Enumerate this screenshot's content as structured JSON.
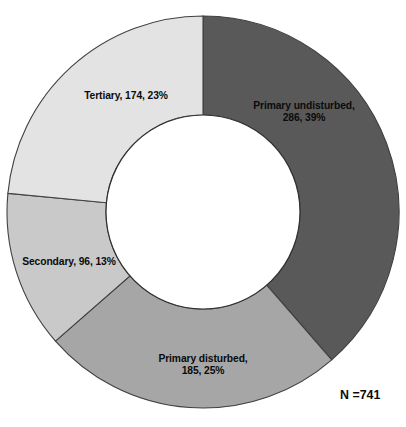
{
  "chart_data": {
    "type": "pie",
    "variant": "donut",
    "title": "",
    "subtitle": "",
    "xlabel": "",
    "ylabel": "",
    "legend_position": "none",
    "grid": false,
    "start_angle_deg": 0,
    "direction": "clockwise",
    "total": 741,
    "total_annotation": "N =741",
    "categories": [
      "Primary undisturbed",
      "Primary disturbed",
      "Secondary",
      "Tertiary"
    ],
    "values": [
      286,
      185,
      96,
      174
    ],
    "percentages": [
      39,
      25,
      13,
      23
    ],
    "slices": [
      {
        "name": "Primary undisturbed",
        "value": 286,
        "percent": 39,
        "label": "Primary undisturbed,\n286, 39%",
        "color": "#595959"
      },
      {
        "name": "Primary disturbed",
        "value": 185,
        "percent": 25,
        "label": "Primary disturbed,\n185, 25%",
        "color": "#a6a6a6"
      },
      {
        "name": "Secondary",
        "value": 96,
        "percent": 13,
        "label": "Secondary, 96, 13%",
        "color": "#c9c9c9"
      },
      {
        "name": "Tertiary",
        "value": 174,
        "percent": 23,
        "label": "Tertiary, 174, 23%",
        "color": "#e3e3e3"
      }
    ]
  },
  "geometry": {
    "center_x": 203,
    "center_y": 212,
    "outer_radius": 196,
    "inner_radius": 97
  },
  "colors": {
    "background": "#ffffff",
    "slice_border": "#404040",
    "hole_fill": "#ffffff",
    "text": "#0b0b0b"
  }
}
